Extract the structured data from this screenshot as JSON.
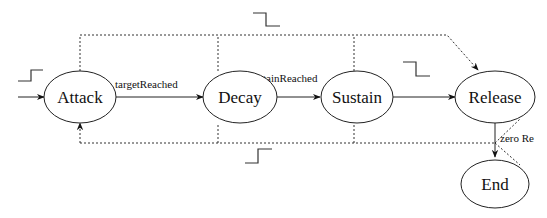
{
  "diagram": {
    "type": "state-machine",
    "states": [
      {
        "id": "attack",
        "label": "Attack"
      },
      {
        "id": "decay",
        "label": "Decay"
      },
      {
        "id": "sustain",
        "label": "Sustain"
      },
      {
        "id": "release",
        "label": "Release"
      },
      {
        "id": "end",
        "label": "End"
      }
    ],
    "transitions": [
      {
        "from": "attack",
        "to": "decay",
        "label": "targetReached",
        "style": "solid"
      },
      {
        "from": "decay",
        "to": "sustain",
        "label": "sustainReached",
        "style": "solid"
      },
      {
        "from": "sustain",
        "to": "release",
        "label": "",
        "style": "solid"
      },
      {
        "from": "release",
        "to": "end",
        "label": "zero Re",
        "style": "solid"
      },
      {
        "from": "attack|decay|sustain",
        "to": "release",
        "label": "",
        "style": "dotted",
        "trigger": "falling-edge"
      },
      {
        "from": "decay|sustain|release",
        "to": "attack",
        "label": "",
        "style": "dotted",
        "trigger": "rising-edge"
      },
      {
        "from": "initial",
        "to": "attack",
        "label": "",
        "style": "solid",
        "trigger": "rising-edge"
      }
    ],
    "triggers": {
      "rising_edge": "rising-edge-symbol",
      "falling_edge": "falling-edge-symbol"
    }
  }
}
